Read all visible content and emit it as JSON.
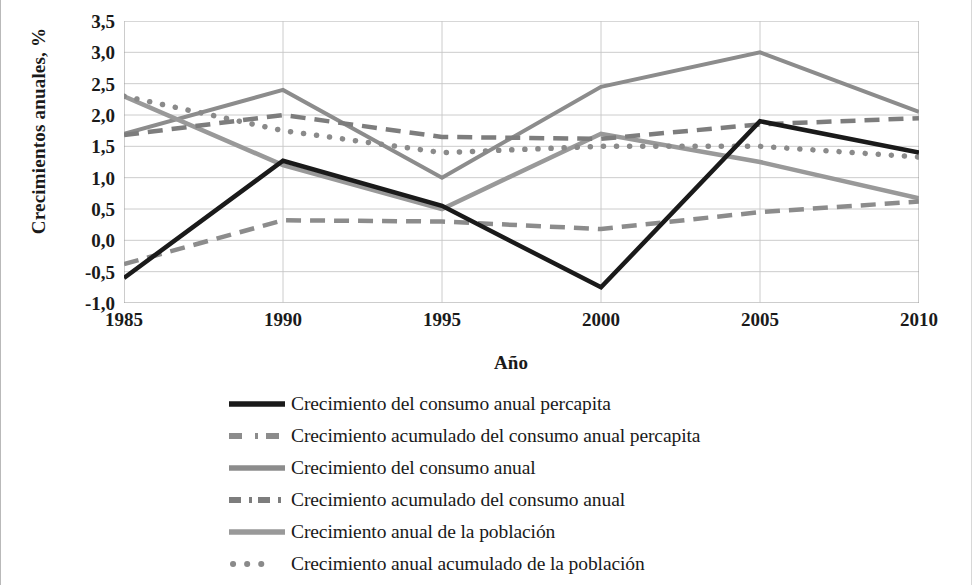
{
  "chart_data": {
    "type": "line",
    "title": "",
    "xlabel": "Año",
    "ylabel": "Crecimientos anuales, %",
    "x": [
      1985,
      1990,
      1995,
      2000,
      2005,
      2010
    ],
    "x_tick_labels": [
      "1985",
      "1990",
      "1995",
      "2000",
      "2005",
      "2010"
    ],
    "y_tick_labels": [
      "3,5",
      "3,0",
      "2,5",
      "2,0",
      "1,5",
      "1,0",
      "0,5",
      "0,0",
      "-0,5",
      "-1,0"
    ],
    "y_ticks": [
      3.5,
      3.0,
      2.5,
      2.0,
      1.5,
      1.0,
      0.5,
      0.0,
      -0.5,
      -1.0
    ],
    "xlim": [
      1985,
      2010
    ],
    "ylim": [
      -1.0,
      3.5
    ],
    "grid": true,
    "legend_position": "bottom",
    "series": [
      {
        "name": "Crecimiento del consumo anual percapita",
        "values": [
          -0.6,
          1.27,
          0.55,
          -0.75,
          1.9,
          1.4
        ],
        "color": "#1a1a1a",
        "style": "solid",
        "width": 4.5
      },
      {
        "name": "Crecimiento acumulado del consumo anual percapita",
        "values": [
          -0.38,
          0.32,
          0.3,
          0.18,
          0.45,
          0.62
        ],
        "color": "#8c8c8c",
        "style": "dashed",
        "width": 4.5
      },
      {
        "name": "Crecimiento del consumo anual",
        "values": [
          1.7,
          2.4,
          1.0,
          2.45,
          3.0,
          2.05
        ],
        "color": "#8c8c8c",
        "style": "solid",
        "width": 4.0
      },
      {
        "name": "Crecimiento acumulado del consumo anual",
        "values": [
          1.68,
          2.0,
          1.65,
          1.62,
          1.85,
          1.95
        ],
        "color": "#7d7d7d",
        "style": "dashed",
        "width": 4.5
      },
      {
        "name": "Crecimiento anual de la población",
        "values": [
          2.3,
          1.2,
          0.5,
          1.7,
          1.25,
          0.67
        ],
        "color": "#999999",
        "style": "solid",
        "width": 4.5
      },
      {
        "name": "Crecimiento anual acumulado de la población",
        "values": [
          2.3,
          1.75,
          1.4,
          1.5,
          1.5,
          1.33
        ],
        "color": "#8a8a8a",
        "style": "dotted",
        "width": 5.5
      }
    ]
  },
  "axis": {
    "y_title": "Crecimientos anuales, %",
    "x_title": "Año"
  },
  "legend": {
    "items": [
      {
        "label": "Crecimiento del consumo anual percapita",
        "swatch": "solid-black-line-icon"
      },
      {
        "label": "Crecimiento acumulado del consumo anual percapita",
        "swatch": "dash-dot-grey-line-icon"
      },
      {
        "label": "Crecimiento del consumo anual",
        "swatch": "solid-grey-line-icon"
      },
      {
        "label": "Crecimiento acumulado del consumo anual",
        "swatch": "dashed-grey-line-icon"
      },
      {
        "label": "Crecimiento anual de la población",
        "swatch": "solid-grey-line-icon"
      },
      {
        "label": "Crecimiento anual acumulado de la población",
        "swatch": "dotted-grey-line-icon"
      }
    ]
  },
  "colors": {
    "text": "#1a1a1a",
    "grid": "#c6c6c6",
    "axis": "#9a9a9a",
    "black_series": "#1a1a1a",
    "grey_series": "#8c8c8c"
  }
}
